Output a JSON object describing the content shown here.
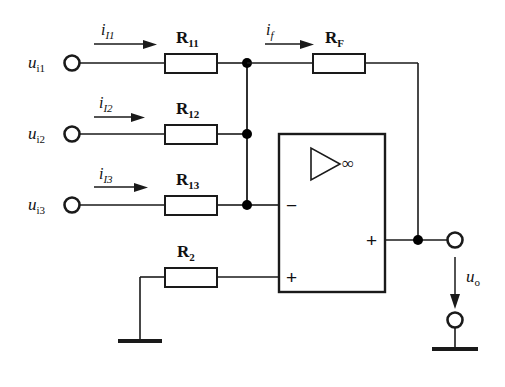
{
  "diagram": {
    "colors": {
      "wire": "#1a1a1a",
      "background": "#ffffff",
      "node": "#000000"
    },
    "inputs": [
      {
        "terminal_label_main": "u",
        "terminal_label_sub": "i1",
        "current_label_main": "i",
        "current_label_sub": "I1",
        "resistor_main": "R",
        "resistor_sub": "11"
      },
      {
        "terminal_label_main": "u",
        "terminal_label_sub": "i2",
        "current_label_main": "i",
        "current_label_sub": "I2",
        "resistor_main": "R",
        "resistor_sub": "12"
      },
      {
        "terminal_label_main": "u",
        "terminal_label_sub": "i3",
        "current_label_main": "i",
        "current_label_sub": "I3",
        "resistor_main": "R",
        "resistor_sub": "13"
      }
    ],
    "feedback": {
      "current_label_main": "i",
      "current_label_sub": "f",
      "resistor_main": "R",
      "resistor_sub": "F"
    },
    "bias": {
      "resistor_main": "R",
      "resistor_sub": "2"
    },
    "opamp": {
      "gain_symbol": "∞",
      "inverting_input_sign": "−",
      "noninverting_input_sign": "+",
      "output_sign": "+"
    },
    "output": {
      "label_main": "u",
      "label_sub": "o"
    }
  }
}
